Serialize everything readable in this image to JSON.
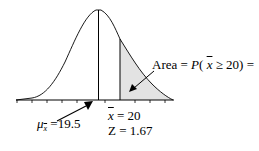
{
  "diagram": {
    "type": "normal-distribution-shaded-right-tail",
    "shade_color": "#e3e3e3",
    "line_color": "#000000",
    "labels": {
      "area": {
        "prefix": "Area = ",
        "func": "P",
        "open": "( ",
        "var": "x",
        "rel": " ≥ 20) ="
      },
      "mean": {
        "symbol": "μ",
        "sub": "x",
        "value": " =19.5"
      },
      "xbar": {
        "var": "x",
        "value": " = 20"
      },
      "z": {
        "var": "Z",
        "value": " = 1.67"
      }
    },
    "values": {
      "mean": 19.5,
      "xbar": 20,
      "z": 1.67
    }
  }
}
